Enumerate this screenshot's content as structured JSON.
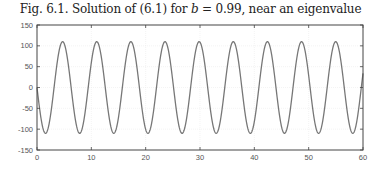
{
  "chart_data": {
    "type": "line",
    "title": "Fig. 6.1.  Solution of (6.1) for b = 0.99, near an eigenvalue",
    "title_parts": {
      "prefix": "Fig. 6.1.  Solution of (6.1) for ",
      "var": "b",
      "suffix": " = 0.99, near an eigenvalue"
    },
    "xlabel": "",
    "ylabel": "",
    "xlim": [
      0,
      60
    ],
    "ylim": [
      -150,
      150
    ],
    "xticks": [
      0,
      10,
      20,
      30,
      40,
      50,
      60
    ],
    "yticks": [
      150,
      100,
      50,
      0,
      -50,
      -100,
      -150
    ],
    "grid": true,
    "legend": null,
    "series": [
      {
        "name": "solution",
        "color": "#777777",
        "description": "sinusoid approx. y = -110·sin(x), period ≈ 2π, amplitude ≈ 110",
        "amplitude": 110,
        "period": 6.283,
        "x_sample": [
          0,
          1.57,
          3.14,
          4.71,
          6.28,
          7.85,
          9.42,
          10.99,
          12.57,
          14.14,
          15.71,
          17.28,
          18.85,
          20.42,
          21.99,
          23.56,
          25.13,
          26.7,
          28.27,
          29.85,
          31.42,
          32.99,
          34.56,
          36.13,
          37.7,
          39.27,
          40.84,
          42.41,
          43.98,
          45.55,
          47.12,
          48.69,
          50.27,
          51.84,
          53.41,
          54.98,
          56.55,
          58.12,
          59.69,
          60
        ],
        "y_sample": [
          0,
          -110,
          0,
          110,
          0,
          -110,
          0,
          110,
          0,
          -110,
          0,
          110,
          0,
          -110,
          0,
          110,
          0,
          -110,
          0,
          110,
          0,
          -110,
          0,
          110,
          0,
          -110,
          0,
          110,
          0,
          -110,
          0,
          110,
          0,
          -110,
          0,
          110,
          0,
          -110,
          0,
          34
        ]
      }
    ]
  }
}
